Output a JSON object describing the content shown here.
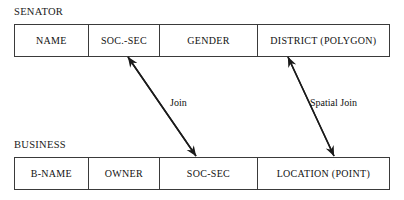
{
  "diagram": {
    "title_senator": "SENATOR",
    "title_business": "BUSINESS",
    "entities": [
      {
        "name": "SENATOR",
        "attributes": [
          {
            "label": "NAME"
          },
          {
            "label": "SOC.-SEC"
          },
          {
            "label": "GENDER"
          },
          {
            "label": "DISTRICT (POLYGON)"
          }
        ]
      },
      {
        "name": "BUSINESS",
        "attributes": [
          {
            "label": "B-NAME"
          },
          {
            "label": "OWNER"
          },
          {
            "label": "SOC-SEC"
          },
          {
            "label": "LOCATION (POINT)"
          }
        ]
      }
    ],
    "relationships": [
      {
        "label": "Join",
        "from": "SENATOR.SOC.-SEC",
        "to": "BUSINESS.SOC-SEC"
      },
      {
        "label": "Spatial Join",
        "from": "SENATOR.DISTRICT (POLYGON)",
        "to": "BUSINESS.LOCATION (POINT)"
      }
    ],
    "colors": {
      "background": "#ffffff",
      "stroke": "#3a3a3a",
      "text": "#111111",
      "arrow": "#1a1a1a"
    }
  }
}
